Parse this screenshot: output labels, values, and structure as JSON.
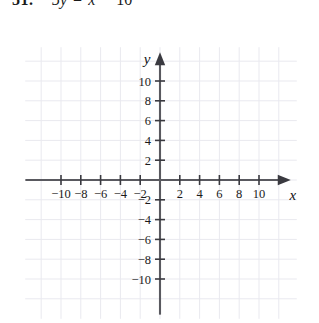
{
  "problem": {
    "number": "51.",
    "equation": {
      "lhs": "5y",
      "operator1": "=",
      "term": "x",
      "operator2": "−",
      "constant": "10"
    }
  },
  "graph": {
    "x_axis_label": "x",
    "y_axis_label": "y",
    "x_ticks": [
      -10,
      -8,
      -6,
      -4,
      -2,
      2,
      4,
      6,
      8,
      10
    ],
    "y_ticks": [
      10,
      8,
      6,
      4,
      2,
      -2,
      -4,
      -6,
      -8,
      -10
    ],
    "x_tick_labels": [
      "−10",
      "−8",
      "−6",
      "−4",
      "−2",
      "2",
      "4",
      "6",
      "8",
      "10"
    ],
    "y_tick_labels": [
      "10",
      "8",
      "6",
      "4",
      "2",
      "−2",
      "−4",
      "−6",
      "−8",
      "−10"
    ],
    "grid": true,
    "grid_step": 2,
    "xlim": [
      -13,
      13
    ],
    "ylim": [
      -13,
      13
    ],
    "arrow_x": "right-arrowhead",
    "arrow_y": "up-arrowhead"
  },
  "chart_data": {
    "type": "scatter",
    "title": "",
    "subtitle": "",
    "xlabel": "x",
    "ylabel": "y",
    "xlim": [
      -13,
      13
    ],
    "ylim": [
      -13,
      13
    ],
    "xticks": [
      -10,
      -8,
      -6,
      -4,
      -2,
      2,
      4,
      6,
      8,
      10
    ],
    "yticks": [
      -10,
      -8,
      -6,
      -4,
      -2,
      2,
      4,
      6,
      8,
      10
    ],
    "grid": true,
    "legend": "none",
    "series": [],
    "annotations": [
      "51.  5y = x − 10"
    ],
    "note": "Blank coordinate plane provided for graphing; no data plotted."
  },
  "colors": {
    "axis": "#3a3a40",
    "grid": "#e9e9ef",
    "text": "#1a1a1a",
    "background": "#ffffff"
  }
}
